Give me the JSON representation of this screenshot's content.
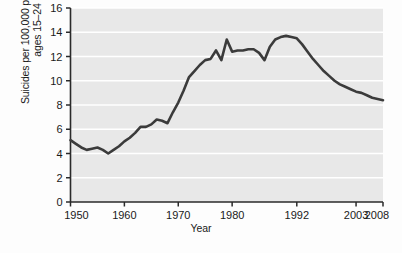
{
  "chart_data": {
    "type": "line",
    "title": "",
    "xlabel": "Year",
    "ylabel": "Suicides per 100,000 population,\nages 15–24",
    "ylim": [
      0,
      16
    ],
    "yticks": [
      0,
      2,
      4,
      6,
      8,
      10,
      12,
      14,
      16
    ],
    "ytick_labels": [
      "0",
      "2",
      "4",
      "6",
      "8",
      "10",
      "12",
      "14",
      "16"
    ],
    "xlim": [
      1950,
      2008
    ],
    "xticks": [
      1950,
      1960,
      1970,
      1980,
      1992,
      2003,
      2008
    ],
    "xtick_labels": [
      "1950",
      "1960",
      "1970",
      "1980",
      "1992",
      "2003",
      "2008"
    ],
    "grid": "horizontal-white-gridlines",
    "plot_background": "#e8e8e8",
    "line_color": "#3b3b3b",
    "line_width": 2.6,
    "legend": null,
    "series": [
      {
        "name": "Suicides per 100,000 population, ages 15-24",
        "x": [
          1950,
          1951,
          1952,
          1953,
          1954,
          1955,
          1956,
          1957,
          1958,
          1959,
          1960,
          1961,
          1962,
          1963,
          1964,
          1965,
          1966,
          1967,
          1968,
          1969,
          1970,
          1971,
          1972,
          1973,
          1974,
          1975,
          1976,
          1977,
          1978,
          1979,
          1980,
          1981,
          1982,
          1983,
          1984,
          1985,
          1986,
          1987,
          1988,
          1989,
          1990,
          1991,
          1992,
          1993,
          1994,
          1995,
          1996,
          1997,
          1998,
          1999,
          2000,
          2001,
          2002,
          2003,
          2004,
          2005,
          2006,
          2007,
          2008
        ],
        "values": [
          5.1,
          4.8,
          4.5,
          4.3,
          4.4,
          4.5,
          4.3,
          4.0,
          4.3,
          4.6,
          5.0,
          5.3,
          5.7,
          6.2,
          6.2,
          6.4,
          6.8,
          6.7,
          6.5,
          7.4,
          8.2,
          9.2,
          10.3,
          10.8,
          11.3,
          11.7,
          11.8,
          12.5,
          11.7,
          13.4,
          12.4,
          12.5,
          12.5,
          12.6,
          12.6,
          12.3,
          11.7,
          12.8,
          13.4,
          13.6,
          13.7,
          13.6,
          13.5,
          13.0,
          12.4,
          11.8,
          11.3,
          10.8,
          10.4,
          10.0,
          9.7,
          9.5,
          9.3,
          9.1,
          9.0,
          8.8,
          8.6,
          8.5,
          8.4
        ]
      }
    ]
  },
  "axis": {
    "ylabel_text": "Suicides per 100,000 population,\nages 15–24",
    "xlabel_text": "Year"
  }
}
